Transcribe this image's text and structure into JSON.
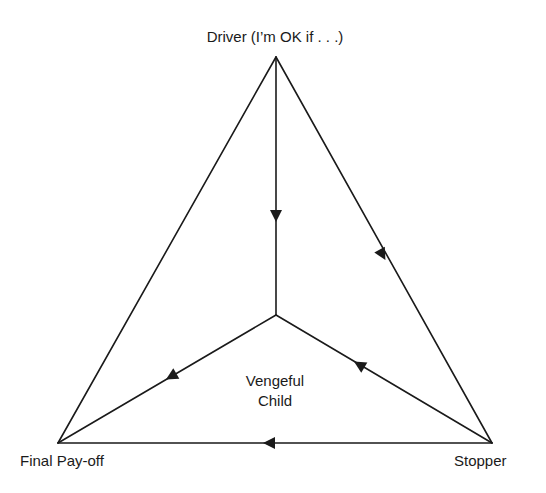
{
  "diagram": {
    "type": "triangle-flow",
    "nodes": {
      "top": {
        "label": "Driver (I’m OK if . . .)"
      },
      "bottom_left": {
        "label": "Final Pay-off"
      },
      "bottom_right": {
        "label": "Stopper"
      },
      "center": {
        "label_line1": "Vengeful",
        "label_line2": "Child"
      }
    },
    "edges": [
      {
        "from": "Driver",
        "to": "Vengeful Child",
        "arrow_toward": "Vengeful Child"
      },
      {
        "from": "Driver",
        "to": "Stopper",
        "arrow_toward": "Stopper"
      },
      {
        "from": "Stopper",
        "to": "Vengeful Child",
        "arrow_toward": "Vengeful Child"
      },
      {
        "from": "Vengeful Child",
        "to": "Final Pay-off",
        "arrow_toward": "Final Pay-off"
      },
      {
        "from": "Stopper",
        "to": "Final Pay-off",
        "arrow_toward": "Final Pay-off"
      },
      {
        "from": "Driver",
        "to": "Final Pay-off",
        "arrow_toward": null
      }
    ],
    "colors": {
      "line": "#1a1a1a",
      "background": "#ffffff"
    }
  }
}
